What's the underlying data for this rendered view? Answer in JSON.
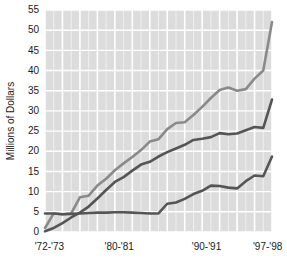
{
  "chart_data": {
    "type": "line",
    "title": "",
    "subtitle": "",
    "xlabel": "",
    "ylabel": "Millions of Dollars",
    "ylim": [
      0,
      55
    ],
    "xlim": [
      1972,
      1998
    ],
    "y_ticks": [
      0,
      5,
      10,
      15,
      20,
      25,
      30,
      35,
      40,
      45,
      50,
      55
    ],
    "y_tick_labels": [
      "0",
      "5",
      "10",
      "15",
      "20",
      "25",
      "30",
      "35",
      "40",
      "45",
      "50",
      "55"
    ],
    "x_ticks": [
      1972.5,
      1980.5,
      1990.5,
      1997.5
    ],
    "x_tick_labels": [
      "'72-'73",
      "'80-'81",
      "'90-'91",
      "'97-'98"
    ],
    "grid": true,
    "grid_color": "#ffffff",
    "plot_background": "#dcdcdc",
    "legend": "none",
    "annotations": [],
    "x": [
      1972,
      1973,
      1974,
      1975,
      1976,
      1977,
      1978,
      1979,
      1980,
      1981,
      1982,
      1983,
      1984,
      1985,
      1986,
      1987,
      1988,
      1989,
      1990,
      1991,
      1992,
      1993,
      1994,
      1995,
      1996,
      1997,
      1998
    ],
    "series": [
      {
        "name": "upper-line",
        "color": "#8a8a8a",
        "values": [
          1.0,
          4.6,
          4.4,
          4.6,
          8.6,
          9.0,
          11.5,
          13.2,
          15.3,
          17.0,
          18.6,
          20.3,
          22.4,
          23.0,
          25.5,
          27.0,
          27.2,
          29.0,
          31.0,
          33.2,
          35.2,
          35.8,
          35.0,
          35.4,
          38.0,
          40.0,
          52.0
        ]
      },
      {
        "name": "middle-line",
        "color": "#555555",
        "values": [
          0.2,
          1.0,
          2.2,
          3.6,
          4.8,
          6.3,
          8.3,
          10.4,
          12.4,
          13.6,
          15.2,
          16.7,
          17.4,
          18.7,
          19.8,
          20.7,
          21.6,
          22.8,
          23.1,
          23.5,
          24.5,
          24.2,
          24.4,
          25.2,
          26.0,
          25.8,
          32.8
        ]
      },
      {
        "name": "lower-line",
        "color": "#555555",
        "values": [
          4.6,
          4.6,
          4.4,
          4.5,
          4.6,
          4.7,
          4.8,
          4.8,
          4.9,
          4.9,
          4.8,
          4.7,
          4.6,
          4.6,
          7.0,
          7.3,
          8.2,
          9.4,
          10.2,
          11.5,
          11.4,
          11.0,
          10.8,
          12.6,
          14.0,
          13.8,
          18.7
        ]
      }
    ]
  }
}
